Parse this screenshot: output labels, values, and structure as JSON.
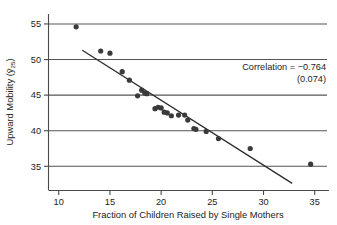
{
  "chart_data": {
    "type": "scatter",
    "title": "",
    "xlabel": "Fraction of Children Raised by Single Mothers",
    "ylabel": "Upward Mobility (ȳ25)",
    "ylabel_parts": {
      "prefix": "Upward Mobility (",
      "symbol": "ȳ",
      "subscript": "25",
      "suffix": ")"
    },
    "xlim": [
      9.0,
      36.2
    ],
    "ylim": [
      31.6,
      56.4
    ],
    "xticks": [
      10,
      15,
      20,
      25,
      30,
      35
    ],
    "xticklabels": [
      "10",
      "15",
      "20",
      "25",
      "30",
      "35"
    ],
    "yticks": [
      35,
      40,
      45,
      50,
      55
    ],
    "yticklabels": [
      "35",
      "40",
      "45",
      "50",
      "55"
    ],
    "grid": "horizontal",
    "legend": "none",
    "points": [
      {
        "x": 11.7,
        "y": 54.6
      },
      {
        "x": 14.1,
        "y": 51.2
      },
      {
        "x": 15.0,
        "y": 50.9
      },
      {
        "x": 16.2,
        "y": 48.3
      },
      {
        "x": 16.9,
        "y": 47.1
      },
      {
        "x": 17.7,
        "y": 44.9
      },
      {
        "x": 18.1,
        "y": 45.7
      },
      {
        "x": 18.4,
        "y": 45.3
      },
      {
        "x": 18.6,
        "y": 45.2
      },
      {
        "x": 19.4,
        "y": 43.1
      },
      {
        "x": 19.7,
        "y": 43.3
      },
      {
        "x": 20.0,
        "y": 43.2
      },
      {
        "x": 20.3,
        "y": 42.6
      },
      {
        "x": 20.6,
        "y": 42.5
      },
      {
        "x": 21.0,
        "y": 42.1
      },
      {
        "x": 21.7,
        "y": 42.2
      },
      {
        "x": 22.3,
        "y": 42.2
      },
      {
        "x": 22.6,
        "y": 41.5
      },
      {
        "x": 23.2,
        "y": 40.3
      },
      {
        "x": 23.4,
        "y": 40.2
      },
      {
        "x": 24.4,
        "y": 39.9
      },
      {
        "x": 25.6,
        "y": 38.9
      },
      {
        "x": 28.7,
        "y": 37.5
      },
      {
        "x": 34.6,
        "y": 35.3
      }
    ],
    "fit_line": {
      "x_start": 12.3,
      "y_start": 51.3,
      "x_end": 32.8,
      "y_end": 32.6
    },
    "annotations": {
      "correlation_label": "Correlation",
      "correlation_equals": "=",
      "correlation_value": "−0.764",
      "correlation_line1": "Correlation  =  −0.764",
      "correlation_line2": "(0.074)"
    },
    "colors": {
      "point": "#3a3a3a",
      "fit_line": "#2b2b2b",
      "grid": "#555555",
      "axis": "#4a4a4a",
      "text": "#1c1c1c",
      "background": "#ffffff"
    }
  }
}
